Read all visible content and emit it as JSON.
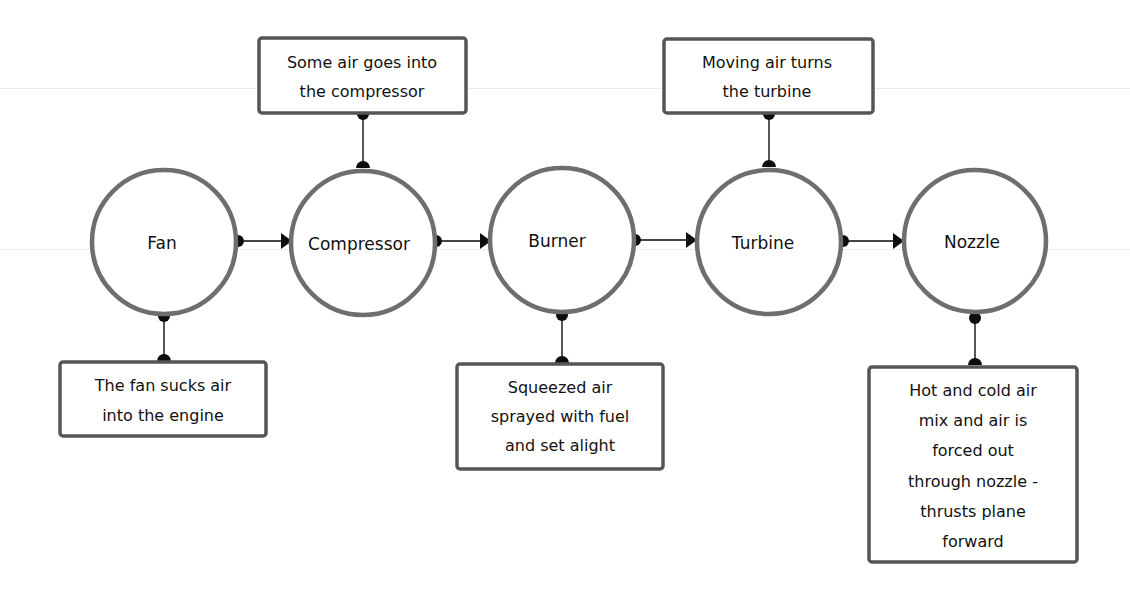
{
  "diagram": {
    "type": "flowchart",
    "direction": "left-to-right",
    "colors": {
      "circle_stroke": "#6e6e6e",
      "box_stroke": "#555555",
      "connector": "#0d0d0d",
      "text": "#111111",
      "background": "#ffffff"
    },
    "nodes": [
      {
        "id": "fan",
        "label": "Fan"
      },
      {
        "id": "compressor",
        "label": "Compressor"
      },
      {
        "id": "burner",
        "label": "Burner"
      },
      {
        "id": "turbine",
        "label": "Turbine"
      },
      {
        "id": "nozzle",
        "label": "Nozzle"
      }
    ],
    "edges": [
      {
        "from": "fan",
        "to": "compressor"
      },
      {
        "from": "compressor",
        "to": "burner"
      },
      {
        "from": "burner",
        "to": "turbine"
      },
      {
        "from": "turbine",
        "to": "nozzle"
      }
    ],
    "notes": [
      {
        "attached_to": "fan",
        "position": "below",
        "lines": [
          "The fan sucks air",
          "into the engine"
        ]
      },
      {
        "attached_to": "compressor",
        "position": "above",
        "lines": [
          "Some air goes into",
          "the compressor"
        ]
      },
      {
        "attached_to": "burner",
        "position": "below",
        "lines": [
          "Squeezed air",
          "sprayed with fuel",
          "and set alight"
        ]
      },
      {
        "attached_to": "turbine",
        "position": "above",
        "lines": [
          "Moving air turns",
          "the turbine"
        ]
      },
      {
        "attached_to": "nozzle",
        "position": "below",
        "lines": [
          "Hot and cold air",
          "mix and air is",
          "forced out",
          "through nozzle -",
          "thrusts plane",
          "forward"
        ]
      }
    ]
  }
}
